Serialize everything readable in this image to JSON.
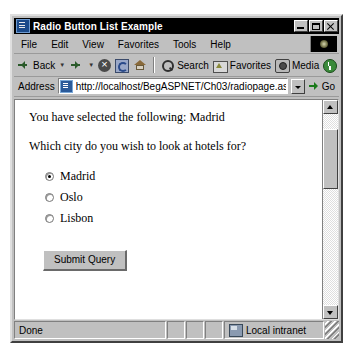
{
  "window": {
    "title": "Radio Button List Example",
    "app_icon": "ie-document-icon",
    "controls": {
      "minimize": "Minimize",
      "maximize": "Maximize",
      "close": "Close"
    }
  },
  "menubar": {
    "items": [
      {
        "label": "File"
      },
      {
        "label": "Edit"
      },
      {
        "label": "View"
      },
      {
        "label": "Favorites"
      },
      {
        "label": "Tools"
      },
      {
        "label": "Help"
      }
    ],
    "logo": "ie-logo-icon"
  },
  "toolbar": {
    "buttons": [
      {
        "label": "Back",
        "icon": "back-arrow-icon",
        "has_caret": true
      },
      {
        "label": "",
        "icon": "forward-arrow-icon",
        "has_caret": true
      },
      {
        "label": "",
        "icon": "stop-icon",
        "has_caret": false
      },
      {
        "label": "",
        "icon": "refresh-icon",
        "has_caret": false
      },
      {
        "label": "",
        "icon": "home-icon",
        "has_caret": false
      },
      {
        "label": "Search",
        "icon": "search-icon",
        "has_caret": false
      },
      {
        "label": "Favorites",
        "icon": "favorites-icon",
        "has_caret": false
      },
      {
        "label": "Media",
        "icon": "media-icon",
        "has_caret": false
      },
      {
        "label": "",
        "icon": "history-icon",
        "has_caret": false
      }
    ],
    "overflow": "»"
  },
  "address": {
    "label": "Address",
    "url": "http://localhost/BegASPNET/Ch03/radiopage.aspx",
    "placeholder": "Address",
    "page_icon": "page-document-icon",
    "dropdown": "chevron-down-icon",
    "go_label": "Go",
    "go_icon": "go-arrow-icon"
  },
  "page": {
    "selection_text": "You have selected the following: Madrid",
    "question_text": "Which city do you wish to look at hotels for?",
    "radio_group": {
      "name": "city",
      "selected": "Madrid",
      "options": [
        {
          "label": "Madrid",
          "checked": true
        },
        {
          "label": "Oslo",
          "checked": false
        },
        {
          "label": "Lisbon",
          "checked": false
        }
      ]
    },
    "submit_label": "Submit Query"
  },
  "scrollbar": {
    "up_icon": "scroll-up-arrow-icon",
    "down_icon": "scroll-down-arrow-icon",
    "thumb_position_pct": 8
  },
  "statusbar": {
    "status_text": "Done",
    "zone_text": "Local intranet",
    "zone_icon": "network-zone-icon"
  },
  "colors": {
    "chrome": "#c0c0c0",
    "titlebar": "#000000",
    "titlebar_text": "#ffffff",
    "page_background": "#ffffff",
    "text": "#000000"
  }
}
